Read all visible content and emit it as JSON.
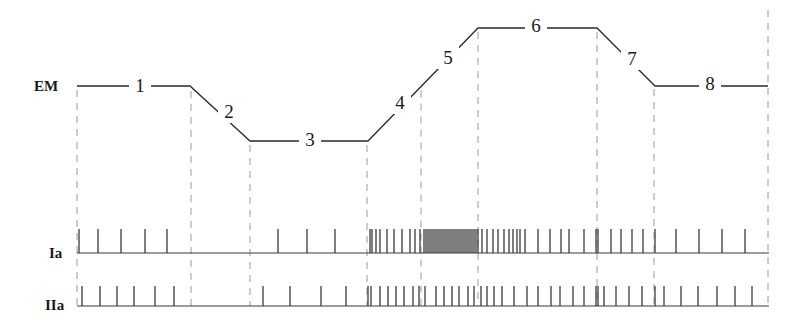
{
  "figure": {
    "row_labels": {
      "em": "EM",
      "ia": "Ia",
      "iia": "IIa"
    },
    "phase_labels": [
      "1",
      "2",
      "3",
      "4",
      "5",
      "6",
      "7",
      "8"
    ],
    "em_trace": {
      "points": [
        [
          77,
          86
        ],
        [
          190,
          86
        ],
        [
          250,
          141
        ],
        [
          368,
          141
        ],
        [
          478,
          28
        ],
        [
          597,
          28
        ],
        [
          655,
          86
        ],
        [
          768,
          86
        ]
      ],
      "label_positions": [
        {
          "text": "1",
          "x": 140,
          "y": 92
        },
        {
          "text": "2",
          "x": 229,
          "y": 118
        },
        {
          "text": "3",
          "x": 310,
          "y": 146
        },
        {
          "text": "4",
          "x": 400,
          "y": 109
        },
        {
          "text": "5",
          "x": 448,
          "y": 64
        },
        {
          "text": "6",
          "x": 536,
          "y": 32
        },
        {
          "text": "7",
          "x": 632,
          "y": 65
        },
        {
          "text": "8",
          "x": 710,
          "y": 90
        }
      ]
    },
    "phase_boundaries_x": [
      77,
      191,
      250,
      367,
      421,
      478,
      597,
      654,
      768
    ],
    "ia": {
      "baseline_y": 253,
      "spike_top_y": 229,
      "spikes_x": [
        79,
        98,
        121,
        145,
        167,
        278,
        307,
        335,
        370,
        372,
        376,
        380,
        387,
        394,
        402,
        410,
        415,
        420,
        424,
        426,
        428,
        430,
        432,
        434,
        436,
        438,
        440,
        442,
        444,
        446,
        448,
        450,
        452,
        454,
        456,
        458,
        460,
        462,
        464,
        466,
        468,
        470,
        472,
        474,
        476,
        478,
        482,
        487,
        493,
        498,
        504,
        509,
        513,
        517,
        520,
        525,
        538,
        550,
        561,
        569,
        584,
        596,
        598,
        611,
        621,
        632,
        643,
        655,
        676,
        699,
        722,
        745
      ]
    },
    "iia": {
      "baseline_y": 306,
      "spike_top_y": 286,
      "spikes_x": [
        82,
        100,
        117,
        134,
        155,
        174,
        263,
        290,
        321,
        346,
        368,
        371,
        380,
        388,
        396,
        404,
        413,
        419,
        425,
        436,
        444,
        452,
        459,
        468,
        474,
        481,
        487,
        494,
        502,
        514,
        527,
        538,
        551,
        560,
        573,
        584,
        596,
        598,
        604,
        616,
        629,
        642,
        655,
        664,
        681,
        698,
        717,
        735,
        752
      ]
    },
    "colors": {
      "ink": "#2a2a2a",
      "dashed_guides": "#9a9a9a",
      "background": "#ffffff"
    }
  }
}
